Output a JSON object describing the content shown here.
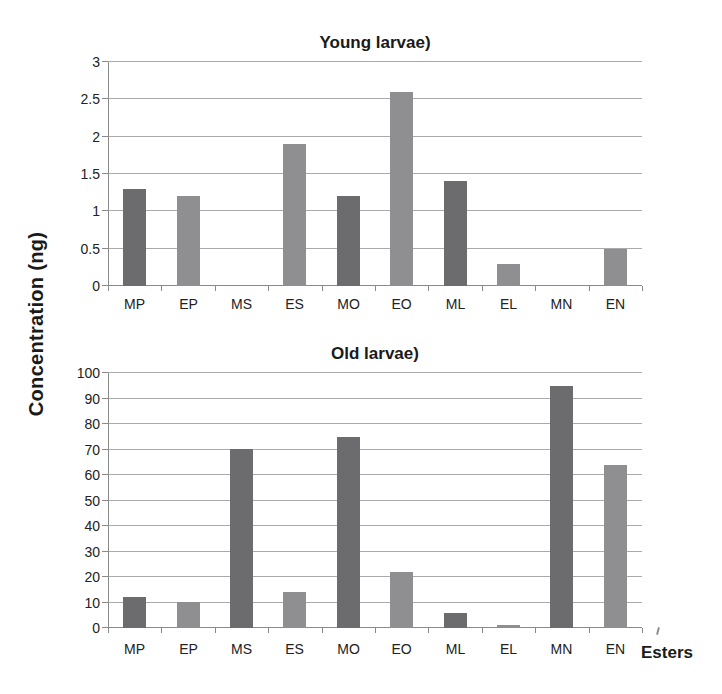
{
  "figure": {
    "ylabel": "Concentration (ng)",
    "xlabel": "Esters"
  },
  "colors": {
    "bar_dark": "#6c6c6e",
    "bar_light": "#8f8f91",
    "gridline": "#ababab",
    "axis": "#8a8a8a",
    "text": "#1a1a1a",
    "background": "#ffffff"
  },
  "chart_data": [
    {
      "type": "bar",
      "title": "Young larvae)",
      "categories": [
        "MP",
        "EP",
        "MS",
        "ES",
        "MO",
        "EO",
        "ML",
        "EL",
        "MN",
        "EN"
      ],
      "values": [
        1.3,
        1.2,
        0,
        1.9,
        1.2,
        2.6,
        1.4,
        0.3,
        0,
        0.5
      ],
      "bar_colors": [
        "#6c6c6e",
        "#8f8f91",
        "#6c6c6e",
        "#8f8f91",
        "#6c6c6e",
        "#8f8f91",
        "#6c6c6e",
        "#8f8f91",
        "#6c6c6e",
        "#8f8f91"
      ],
      "ylim": [
        0,
        3
      ],
      "yticks": [
        0,
        0.5,
        1,
        1.5,
        2,
        2.5,
        3
      ],
      "xlabel": "",
      "ylabel": "Concentration (ng)",
      "grid": true,
      "legend": false
    },
    {
      "type": "bar",
      "title": "Old larvae)",
      "categories": [
        "MP",
        "EP",
        "MS",
        "ES",
        "MO",
        "EO",
        "ML",
        "EL",
        "MN",
        "EN"
      ],
      "values": [
        12,
        10,
        70,
        14,
        75,
        22,
        6,
        1,
        95,
        64
      ],
      "bar_colors": [
        "#6c6c6e",
        "#8f8f91",
        "#6c6c6e",
        "#8f8f91",
        "#6c6c6e",
        "#8f8f91",
        "#6c6c6e",
        "#8f8f91",
        "#6c6c6e",
        "#8f8f91"
      ],
      "ylim": [
        0,
        100
      ],
      "yticks": [
        0,
        10,
        20,
        30,
        40,
        50,
        60,
        70,
        80,
        90,
        100
      ],
      "xlabel": "Esters",
      "ylabel": "Concentration (ng)",
      "grid": true,
      "legend": false
    }
  ]
}
